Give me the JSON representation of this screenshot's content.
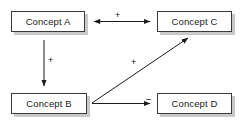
{
  "diagram": {
    "background_color": "#ffffff",
    "node_fill": "#ffffff",
    "node_border": "#3a3a3a",
    "node_shadow": "#c9c9c9",
    "line_color": "#1b1b1b",
    "nodes": [
      {
        "id": "a",
        "label": "Concept A"
      },
      {
        "id": "c",
        "label": "Concept C"
      },
      {
        "id": "b",
        "label": "Concept B"
      },
      {
        "id": "d",
        "label": "Concept D"
      }
    ],
    "edges": [
      {
        "id": "ac",
        "from": "Concept A",
        "to": "Concept C",
        "sign": "+",
        "arrow": "double",
        "orientation": "horizontal"
      },
      {
        "id": "ab",
        "from": "Concept A",
        "to": "Concept B",
        "sign": "+",
        "arrow": "single",
        "orientation": "vertical"
      },
      {
        "id": "bc",
        "from": "Concept B",
        "to": "Concept C",
        "sign": "+",
        "arrow": "single",
        "orientation": "diagonal"
      },
      {
        "id": "bd",
        "from": "Concept B",
        "to": "Concept D",
        "sign": "–",
        "arrow": "single",
        "orientation": "horizontal"
      }
    ]
  }
}
